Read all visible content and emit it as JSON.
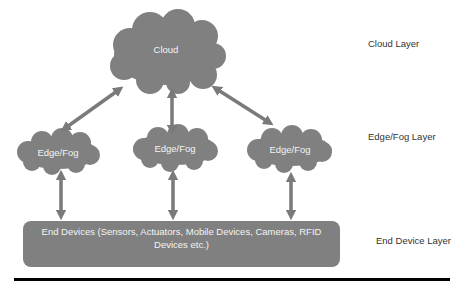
{
  "colors": {
    "node_fill": "#808080",
    "arrow_fill": "#7a7a7a",
    "node_text": "#f4f4f4",
    "label_text": "#333333",
    "rule": "#000000",
    "background": "#ffffff"
  },
  "nodes": {
    "cloud": {
      "label": "Cloud"
    },
    "edge_left": {
      "label": "Edge/Fog"
    },
    "edge_center": {
      "label": "Edge/Fog"
    },
    "edge_right": {
      "label": "Edge/Fog"
    },
    "end_devices": {
      "label": "End Devices (Sensors, Actuators, Mobile Devices, Cameras, RFID Devices etc.)"
    }
  },
  "layers": {
    "cloud": "Cloud Layer",
    "edge_fog": "Edge/Fog Layer",
    "end_device": "End Device Layer"
  },
  "edges": [
    {
      "from": "cloud",
      "to": "edge_left",
      "type": "bidirectional"
    },
    {
      "from": "cloud",
      "to": "edge_center",
      "type": "bidirectional"
    },
    {
      "from": "cloud",
      "to": "edge_right",
      "type": "bidirectional"
    },
    {
      "from": "edge_left",
      "to": "end_devices",
      "type": "bidirectional"
    },
    {
      "from": "edge_center",
      "to": "end_devices",
      "type": "bidirectional"
    },
    {
      "from": "edge_right",
      "to": "end_devices",
      "type": "bidirectional"
    }
  ]
}
